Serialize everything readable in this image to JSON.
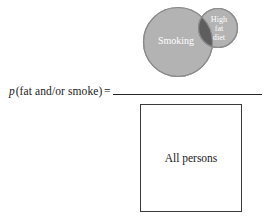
{
  "figure": {
    "equation": {
      "variable": "p",
      "argument": "(fat and/or smoke)",
      "operator": "=",
      "full_text": "p(fat and/or smoke) ="
    },
    "numerator": {
      "description": "Venn diagram of two overlapping shaded circles",
      "circles": [
        {
          "id": "smoking",
          "label": "Smoking",
          "fill": "#b3b3b3",
          "stroke": "#8c8c8c"
        },
        {
          "id": "high-fat-diet",
          "label_lines": [
            "High",
            "fat",
            "diet"
          ],
          "label": "High fat diet",
          "fill": "#b3b3b3",
          "stroke": "#8c8c8c"
        }
      ],
      "intersection": {
        "id": "smoking-and-high-fat-diet",
        "fill": "#5e5e5e"
      }
    },
    "denominator": {
      "label": "All persons",
      "stroke": "#3a3a3a",
      "fill": "#ffffff"
    },
    "fraction_bar": {
      "color": "#262626"
    },
    "background": "#ffffff"
  }
}
